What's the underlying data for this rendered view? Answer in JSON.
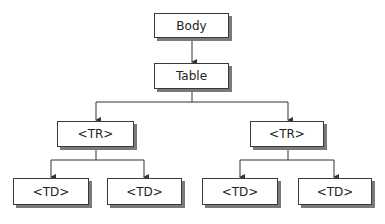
{
  "diagram": {
    "type": "tree",
    "colors": {
      "border": "#3a3a3a",
      "shadow": "#7a7a7a",
      "line": "#333333",
      "background": "#ffffff"
    },
    "nodes": [
      {
        "id": "body",
        "label": "Body",
        "x": 154,
        "y": 13,
        "w": 75,
        "h": 25
      },
      {
        "id": "table",
        "label": "Table",
        "x": 154,
        "y": 63,
        "w": 75,
        "h": 26
      },
      {
        "id": "tr1",
        "label": "<TR>",
        "x": 57,
        "y": 121,
        "w": 77,
        "h": 26
      },
      {
        "id": "tr2",
        "label": "<TR>",
        "x": 250,
        "y": 121,
        "w": 74,
        "h": 26
      },
      {
        "id": "td1",
        "label": "<TD>",
        "x": 13,
        "y": 178,
        "w": 76,
        "h": 27
      },
      {
        "id": "td2",
        "label": "<TD>",
        "x": 107,
        "y": 178,
        "w": 75,
        "h": 27
      },
      {
        "id": "td3",
        "label": "<TD>",
        "x": 202,
        "y": 178,
        "w": 76,
        "h": 27
      },
      {
        "id": "td4",
        "label": "<TD>",
        "x": 298,
        "y": 178,
        "w": 74,
        "h": 27
      }
    ],
    "edges": [
      {
        "from": "body",
        "to": "table"
      },
      {
        "from": "table",
        "to": "tr1"
      },
      {
        "from": "table",
        "to": "tr2"
      },
      {
        "from": "tr1",
        "to": "td1"
      },
      {
        "from": "tr1",
        "to": "td2"
      },
      {
        "from": "tr2",
        "to": "td3"
      },
      {
        "from": "tr2",
        "to": "td4"
      }
    ]
  }
}
